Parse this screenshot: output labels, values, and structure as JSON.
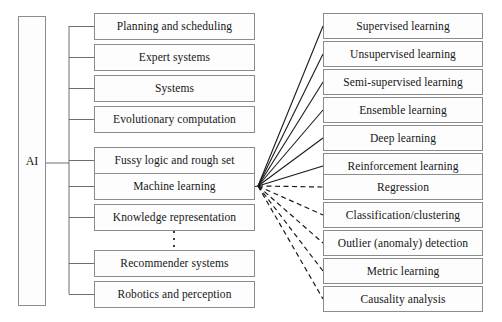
{
  "diagram": {
    "root": {
      "label": "AI",
      "x": 18,
      "y": 16,
      "w": 28,
      "h": 290
    },
    "style": {
      "box_border_color": "#8c8c8c",
      "box_fill_color": "#fdfdfd",
      "solid_edge_color": "#1a1a1a",
      "dashed_edge_color": "#1a1a1a",
      "text_color": "#161616"
    },
    "branch_nodes": [
      {
        "label": "Planning and scheduling",
        "x": 94,
        "y": 13,
        "w": 161,
        "h": 27
      },
      {
        "label": "Expert systems",
        "x": 94,
        "y": 44,
        "w": 161,
        "h": 27
      },
      {
        "label": "Systems",
        "x": 94,
        "y": 75,
        "w": 161,
        "h": 27
      },
      {
        "label": "Evolutionary computation",
        "x": 94,
        "y": 106,
        "w": 161,
        "h": 27
      },
      {
        "label": "Fussy logic and rough set",
        "x": 94,
        "y": 147,
        "w": 161,
        "h": 27
      },
      {
        "label": "Machine learning",
        "x": 94,
        "y": 173,
        "w": 161,
        "h": 27
      },
      {
        "label": "Knowledge representation",
        "x": 94,
        "y": 204,
        "w": 161,
        "h": 27
      },
      {
        "label": "Recommender systems",
        "x": 94,
        "y": 250,
        "w": 161,
        "h": 27
      },
      {
        "label": "Robotics and perception",
        "x": 94,
        "y": 281,
        "w": 161,
        "h": 27
      }
    ],
    "ellipsis": {
      "x": 173,
      "y": 231,
      "dots": 3
    },
    "ml_solid_children": [
      {
        "label": "Supervised learning",
        "x": 323,
        "y": 13,
        "w": 160,
        "h": 26
      },
      {
        "label": "Unsupervised learning",
        "x": 323,
        "y": 41,
        "w": 160,
        "h": 26
      },
      {
        "label": "Semi-supervised learning",
        "x": 323,
        "y": 69,
        "w": 160,
        "h": 26
      },
      {
        "label": "Ensemble learning",
        "x": 323,
        "y": 97,
        "w": 160,
        "h": 26
      },
      {
        "label": "Deep learning",
        "x": 323,
        "y": 125,
        "w": 160,
        "h": 26
      },
      {
        "label": "Reinforcement learning",
        "x": 323,
        "y": 153,
        "w": 160,
        "h": 26
      }
    ],
    "ml_dashed_children": [
      {
        "label": "Regression",
        "x": 323,
        "y": 174,
        "w": 160,
        "h": 26
      },
      {
        "label": "Classification/clustering",
        "x": 323,
        "y": 202,
        "w": 160,
        "h": 26
      },
      {
        "label": "Outlier (anomaly) detection",
        "x": 323,
        "y": 230,
        "w": 160,
        "h": 26
      },
      {
        "label": "Metric learning",
        "x": 323,
        "y": 258,
        "w": 160,
        "h": 26
      },
      {
        "label": "Causality analysis",
        "x": 323,
        "y": 286,
        "w": 160,
        "h": 26
      }
    ],
    "hub": {
      "x": 258,
      "y": 186
    },
    "trunk": {
      "x": 69,
      "top": 26,
      "bottom": 294,
      "root_connect_y": 163
    }
  }
}
